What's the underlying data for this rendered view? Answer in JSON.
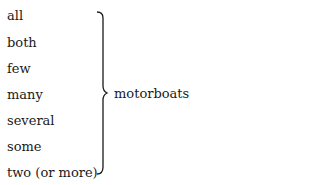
{
  "diagram": {
    "quantifiers": [
      "all",
      "both",
      "few",
      "many",
      "several",
      "some",
      "two (or more)"
    ],
    "noun": "motorboats",
    "connector": "right-curly-brace"
  }
}
